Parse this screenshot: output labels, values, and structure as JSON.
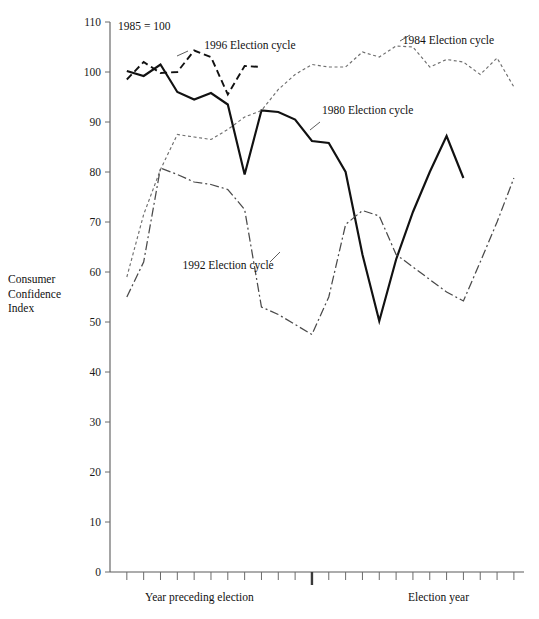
{
  "meta": {
    "note": "1985 = 100",
    "y_axis_title_lines": [
      "Consumer",
      "Confidence",
      "Index"
    ],
    "x_label_left": "Year preceding election",
    "x_label_right": "Election year"
  },
  "chart_data": {
    "type": "line",
    "title": "",
    "subtitle": "",
    "xlabel": "",
    "ylabel": "Consumer Confidence Index",
    "ylim": [
      0,
      110
    ],
    "ytick_labels": [
      "0",
      "10",
      "20",
      "30",
      "40",
      "50",
      "60",
      "70",
      "80",
      "90",
      "100",
      "110"
    ],
    "yticks": [
      0,
      10,
      20,
      30,
      40,
      50,
      60,
      70,
      80,
      90,
      100,
      110
    ],
    "grid": false,
    "legend": "inline-annotations",
    "x_ticks_count": 24,
    "x_major_tick_index": 12,
    "x": [
      1,
      2,
      3,
      4,
      5,
      6,
      7,
      8,
      9,
      10,
      11,
      12,
      13,
      14,
      15,
      16,
      17,
      18,
      19,
      20,
      21,
      22,
      23,
      24
    ],
    "annotations": [
      {
        "text": "1985 = 100",
        "x_index": 1.2,
        "y_value": 108
      },
      {
        "text": "1996 Election cycle",
        "x_index": 5.6,
        "y_value": 105.5
      },
      {
        "text": "1984 Election cycle",
        "x_index": 17.4,
        "y_value": 106.5
      },
      {
        "text": "1980 Election cycle",
        "x_index": 12.6,
        "y_value": 92.5
      },
      {
        "text": "1992 Election cycle",
        "x_index": 4.3,
        "y_value": 61.5
      }
    ],
    "series": [
      {
        "name": "1980 Election cycle",
        "style": "solid-thick",
        "color": "#111111",
        "values": [
          100.2,
          99.2,
          101.5,
          96.0,
          94.5,
          95.8,
          93.5,
          79.5,
          92.3,
          92.0,
          90.5,
          86.2,
          85.8,
          80.0,
          63.5,
          50.2,
          62.5,
          72.0,
          80.0,
          87.2,
          78.8,
          null,
          null,
          null
        ]
      },
      {
        "name": "1996 Election cycle",
        "style": "dashed",
        "color": "#111111",
        "values": [
          98.5,
          102.0,
          99.8,
          100.0,
          104.3,
          103.0,
          95.5,
          101.2,
          101.0,
          null,
          null,
          null,
          null,
          null,
          null,
          null,
          null,
          null,
          null,
          null,
          null,
          null,
          null,
          null
        ]
      },
      {
        "name": "1984 Election cycle",
        "style": "dotted-fine",
        "color": "#6e6e6e",
        "values": [
          59.0,
          71.5,
          80.5,
          87.5,
          87.0,
          86.5,
          88.5,
          91.0,
          92.3,
          96.5,
          99.5,
          101.5,
          101.0,
          101.0,
          104.0,
          103.0,
          105.2,
          105.0,
          101.0,
          102.5,
          102.0,
          99.5,
          102.8,
          97.0
        ]
      },
      {
        "name": "1992 Election cycle",
        "style": "dash-dot",
        "color": "#4a4a4a",
        "values": [
          55.0,
          62.0,
          80.8,
          79.5,
          78.0,
          77.5,
          76.5,
          72.5,
          53.0,
          51.5,
          49.5,
          47.5,
          55.0,
          69.5,
          72.3,
          71.2,
          63.5,
          61.0,
          58.5,
          56.0,
          54.2,
          62.0,
          70.0,
          78.8
        ]
      }
    ]
  }
}
